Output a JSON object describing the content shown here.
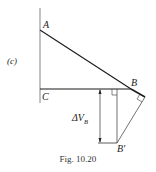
{
  "figure": {
    "panel_label": "(c)",
    "caption": "Fig. 10.20",
    "points": {
      "A": "A",
      "B": "B",
      "C": "C",
      "B_prime": "B'"
    },
    "dimension_label": {
      "main": "ΔV",
      "subscript": "B"
    }
  },
  "colors": {
    "line": "#1a1a1a",
    "thin_line": "#444444",
    "background": "#ffffff"
  }
}
